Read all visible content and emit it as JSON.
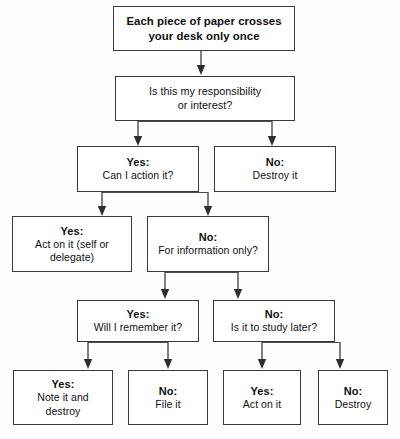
{
  "diagram": {
    "title": "Each piece of paper crosses your desk only once",
    "nodes": [
      {
        "id": "n1",
        "lead": "",
        "body": "Each piece of paper crosses your desk only once",
        "line1": "Each piece of paper crosses",
        "line2": "your desk only once"
      },
      {
        "id": "n2",
        "lead": "",
        "body": "Is this my responsibility or interest?",
        "line1": "Is this my responsibility",
        "line2": "or interest?"
      },
      {
        "id": "n3",
        "lead": "Yes:",
        "body": "Can I action it?"
      },
      {
        "id": "n4",
        "lead": "No:",
        "body": "Destroy it"
      },
      {
        "id": "n5",
        "lead": "Yes:",
        "body": "Act on it (self or delegate)",
        "line1": "Act on it (self or",
        "line2": "delegate)"
      },
      {
        "id": "n6",
        "lead": "No:",
        "body": "For information only?"
      },
      {
        "id": "n7",
        "lead": "Yes:",
        "body": "Will I remember it?"
      },
      {
        "id": "n8",
        "lead": "No:",
        "body": "Is it to study later?"
      },
      {
        "id": "n9",
        "lead": "Yes:",
        "body": "Note it and destroy",
        "line1": "Note it and",
        "line2": "destroy"
      },
      {
        "id": "n10",
        "lead": "No:",
        "body": "File it"
      },
      {
        "id": "n11",
        "lead": "Yes:",
        "body": "Act on it"
      },
      {
        "id": "n12",
        "lead": "No:",
        "body": "Destroy"
      }
    ],
    "colors": {
      "border": "#3a3a3a",
      "text": "#111111",
      "arrow": "#4a4a4a",
      "background": "#fefefe"
    }
  }
}
